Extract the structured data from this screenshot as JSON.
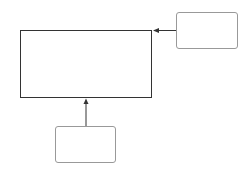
{
  "diagram": {
    "nodes": [
      {
        "id": "main",
        "label": ""
      },
      {
        "id": "right",
        "label": ""
      },
      {
        "id": "bottom",
        "label": ""
      }
    ],
    "edges": [
      {
        "from": "right",
        "to": "main",
        "label": ""
      },
      {
        "from": "bottom",
        "to": "main",
        "label": ""
      }
    ],
    "colors": {
      "main_border": "#333333",
      "side_border": "#999999",
      "edge": "#333333"
    }
  }
}
